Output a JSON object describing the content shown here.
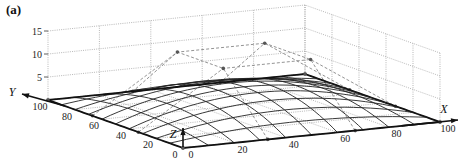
{
  "panel_label": "(a)",
  "chart_data": {
    "type": "3d-surface-wireframe",
    "title": "",
    "panel": "(a)",
    "xlabel": "X",
    "ylabel": "Y",
    "zlabel": "Z",
    "xlim": [
      0,
      100
    ],
    "ylim": [
      0,
      100
    ],
    "zlim": [
      0,
      15
    ],
    "x_ticks": [
      0,
      20,
      40,
      60,
      80,
      100
    ],
    "y_ticks": [
      0,
      20,
      40,
      60,
      80,
      100
    ],
    "z_ticks": [
      5,
      10,
      15
    ],
    "grid": true,
    "control_net": {
      "grid_x": [
        0,
        33,
        67,
        100
      ],
      "grid_y": [
        0,
        33,
        67,
        100
      ],
      "z": [
        [
          0,
          0,
          0,
          0
        ],
        [
          0,
          12,
          12,
          0
        ],
        [
          0,
          12,
          12,
          0
        ],
        [
          0,
          0,
          0,
          0
        ]
      ]
    },
    "surface": {
      "mesh_lines_u": 10,
      "mesh_lines_v": 10,
      "peak_z_approx": 5.3,
      "corner_z": 0
    }
  },
  "axes": {
    "x_label": "X",
    "y_label": "Y",
    "z_label": "Z",
    "x_ticks": [
      "0",
      "20",
      "40",
      "60",
      "80",
      "100"
    ],
    "y_ticks": [
      "0",
      "20",
      "40",
      "60",
      "80",
      "100"
    ],
    "z_ticks": [
      "5",
      "10",
      "15"
    ]
  }
}
